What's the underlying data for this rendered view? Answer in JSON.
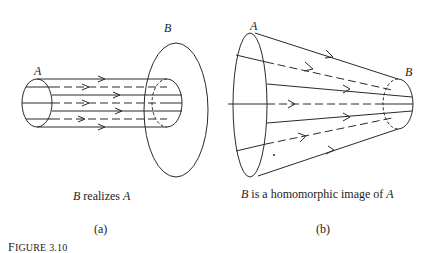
{
  "figure": {
    "label": "FIGURE 3.10",
    "label_first": "F",
    "label_rest": "IGURE 3.10"
  },
  "panels": [
    {
      "id": "a",
      "set_a_label": "A",
      "set_b_label": "B",
      "caption_var1": "B",
      "caption_text": " realizes ",
      "caption_var2": "A",
      "caption": "B realizes A",
      "sublabel": "(a)",
      "description": "Cylinder from A into a larger ellipse B; parallel arrows (solid and dashed) from A to B"
    },
    {
      "id": "b",
      "set_a_label": "A",
      "set_b_label": "B",
      "caption_var1": "B",
      "caption_text": " is a homomorphic image of ",
      "caption_var2": "A",
      "caption": "B is a homomorphic image of A",
      "sublabel": "(b)",
      "description": "Truncated cone from large ellipse A converging to small ellipse B; arrows converge from A to B"
    }
  ],
  "colors": {
    "stroke": "#2a2a2a",
    "background": "#ffffff"
  }
}
